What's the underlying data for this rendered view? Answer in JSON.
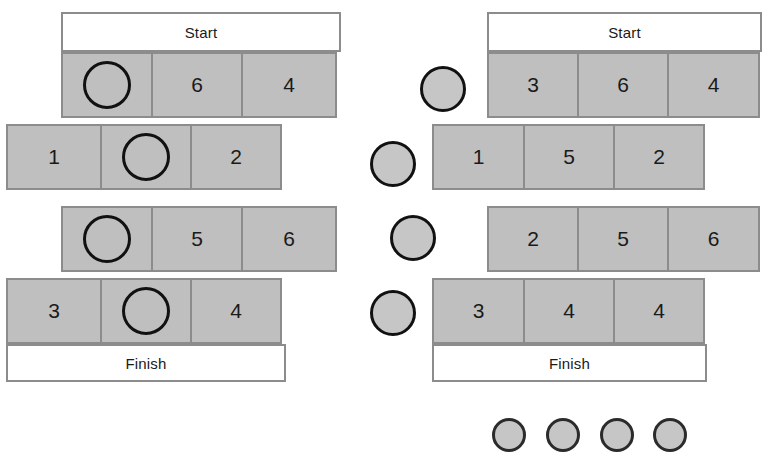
{
  "figure": {
    "kind": "board-game-diagram",
    "background_color": "#ffffff",
    "cell_fill_color": "#bfbfbf",
    "cell_border_color": "#8c8c8c",
    "token_border_color": "#111111",
    "token_fill_color": "#c6c6c6",
    "end_bar_fill_color": "#ffffff"
  },
  "boards": [
    {
      "id": "left-board",
      "name": "Left board",
      "start_label": "Start",
      "finish_label": "Finish",
      "rows": [
        {
          "index": 1,
          "offset": "right",
          "cells": [
            {
              "value": "",
              "token": "hollow"
            },
            {
              "value": "6",
              "token": "none"
            },
            {
              "value": "4",
              "token": "none"
            }
          ]
        },
        {
          "index": 2,
          "offset": "left",
          "cells": [
            {
              "value": "1",
              "token": "none"
            },
            {
              "value": "",
              "token": "hollow"
            },
            {
              "value": "2",
              "token": "none"
            }
          ]
        },
        {
          "index": 3,
          "offset": "right",
          "cells": [
            {
              "value": "",
              "token": "hollow"
            },
            {
              "value": "5",
              "token": "none"
            },
            {
              "value": "6",
              "token": "none"
            }
          ]
        },
        {
          "index": 4,
          "offset": "left",
          "cells": [
            {
              "value": "3",
              "token": "none"
            },
            {
              "value": "",
              "token": "hollow"
            },
            {
              "value": "4",
              "token": "none"
            }
          ]
        }
      ],
      "loose_tokens": []
    },
    {
      "id": "right-board",
      "name": "Right board",
      "start_label": "Start",
      "finish_label": "Finish",
      "rows": [
        {
          "index": 1,
          "offset": "right",
          "cells": [
            {
              "value": "3",
              "token": "none"
            },
            {
              "value": "6",
              "token": "none"
            },
            {
              "value": "4",
              "token": "none"
            }
          ]
        },
        {
          "index": 2,
          "offset": "left",
          "cells": [
            {
              "value": "1",
              "token": "none"
            },
            {
              "value": "5",
              "token": "none"
            },
            {
              "value": "2",
              "token": "none"
            }
          ]
        },
        {
          "index": 3,
          "offset": "right",
          "cells": [
            {
              "value": "2",
              "token": "none"
            },
            {
              "value": "5",
              "token": "none"
            },
            {
              "value": "6",
              "token": "none"
            }
          ]
        },
        {
          "index": 4,
          "offset": "left",
          "cells": [
            {
              "value": "3",
              "token": "none"
            },
            {
              "value": "4",
              "token": "none"
            },
            {
              "value": "4",
              "token": "none"
            }
          ]
        }
      ],
      "loose_tokens": [
        {
          "index": 1,
          "style": "filled"
        },
        {
          "index": 2,
          "style": "filled"
        },
        {
          "index": 3,
          "style": "filled"
        },
        {
          "index": 4,
          "style": "filled"
        }
      ]
    }
  ],
  "edge_stubs": [
    {
      "index": 1
    },
    {
      "index": 2
    },
    {
      "index": 3
    },
    {
      "index": 4
    }
  ]
}
